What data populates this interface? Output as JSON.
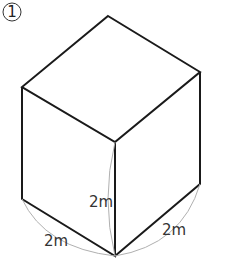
{
  "problem": {
    "number_label": "①"
  },
  "figure": {
    "shape": "cube",
    "dimensions": {
      "height_label": "2m",
      "width_label": "2m",
      "depth_label": "2m"
    },
    "colors": {
      "edge": "#1a1a1a",
      "dimension_arc": "#b0b0b0",
      "label": "#333333"
    }
  }
}
